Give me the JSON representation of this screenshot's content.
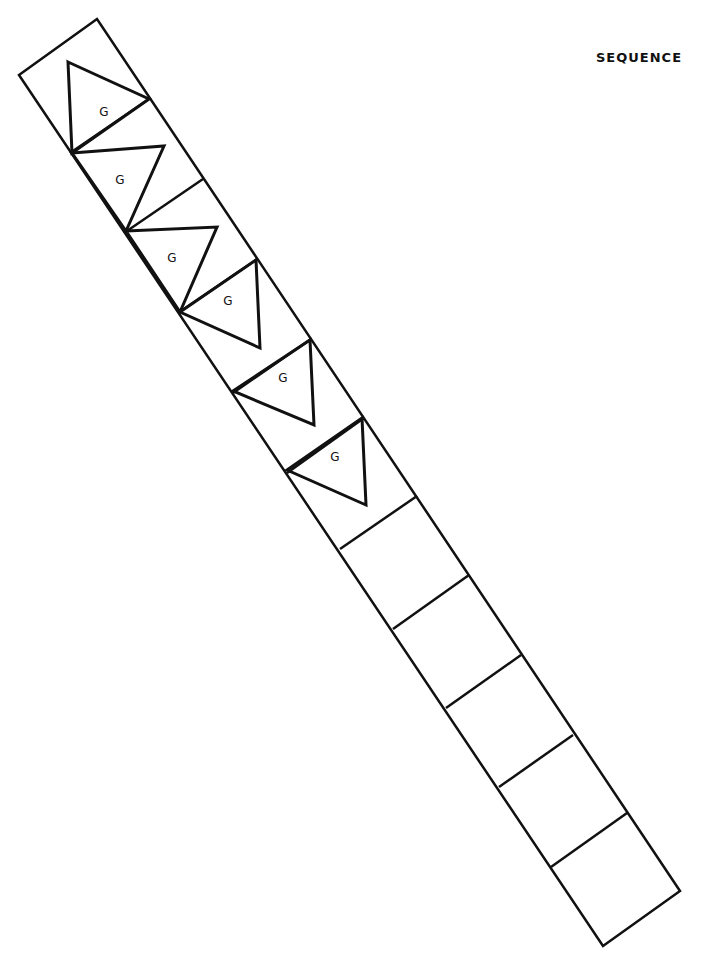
{
  "title": "SEQUENCE",
  "colors": {
    "stroke": "#111111",
    "background": "#ffffff"
  },
  "strip": {
    "cell_count": 12,
    "outline": [
      [
        19,
        75
      ],
      [
        97,
        19
      ],
      [
        680,
        891
      ],
      [
        603,
        946
      ]
    ],
    "dividers": [
      [
        [
          70,
          153
        ],
        [
          149,
          99
        ]
      ],
      [
        [
          124,
          233
        ],
        [
          203,
          179
        ]
      ],
      [
        [
          178,
          313
        ],
        [
          257,
          259
        ]
      ],
      [
        [
          233,
          393
        ],
        [
          311,
          339
        ]
      ],
      [
        [
          287,
          473
        ],
        [
          364,
          418
        ]
      ],
      [
        [
          340,
          549
        ],
        [
          417,
          496
        ]
      ],
      [
        [
          393,
          629
        ],
        [
          469,
          575
        ]
      ],
      [
        [
          446,
          708
        ],
        [
          521,
          655
        ]
      ],
      [
        [
          499,
          787
        ],
        [
          573,
          735
        ]
      ],
      [
        [
          551,
          867
        ],
        [
          627,
          813
        ]
      ]
    ]
  },
  "triangles": [
    {
      "label": "G",
      "points": [
        [
          68,
          62
        ],
        [
          149,
          99
        ],
        [
          72,
          153
        ]
      ],
      "label_pos": [
        104,
        116
      ]
    },
    {
      "label": "G",
      "points": [
        [
          72,
          153
        ],
        [
          164,
          146
        ],
        [
          126,
          231
        ]
      ],
      "label_pos": [
        120,
        184
      ]
    },
    {
      "label": "G",
      "points": [
        [
          126,
          231
        ],
        [
          217,
          227
        ],
        [
          180,
          312
        ]
      ],
      "label_pos": [
        172,
        262
      ]
    },
    {
      "label": "G",
      "points": [
        [
          180,
          312
        ],
        [
          256,
          260
        ],
        [
          260,
          348
        ]
      ],
      "label_pos": [
        228,
        305
      ]
    },
    {
      "label": "G",
      "points": [
        [
          233,
          391
        ],
        [
          310,
          340
        ],
        [
          314,
          425
        ]
      ],
      "label_pos": [
        283,
        382
      ]
    },
    {
      "label": "G",
      "points": [
        [
          287,
          470
        ],
        [
          362,
          418
        ],
        [
          366,
          505
        ]
      ],
      "label_pos": [
        335,
        461
      ]
    }
  ]
}
